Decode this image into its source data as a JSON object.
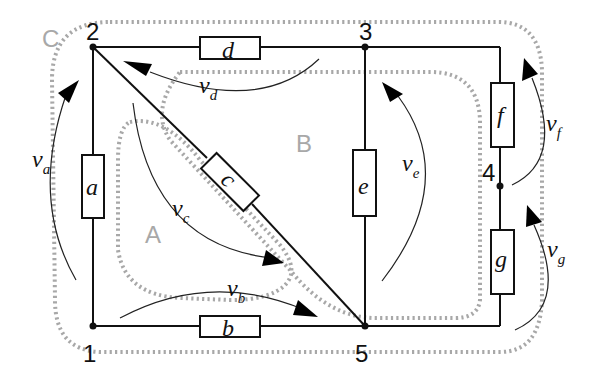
{
  "diagram": {
    "type": "electric-circuit",
    "nodes": [
      {
        "id": "1",
        "label": "1"
      },
      {
        "id": "2",
        "label": "2"
      },
      {
        "id": "3",
        "label": "3"
      },
      {
        "id": "4",
        "label": "4"
      },
      {
        "id": "5",
        "label": "5"
      }
    ],
    "branches": [
      {
        "id": "a",
        "label": "a",
        "from": "1",
        "to": "2",
        "voltage": {
          "symbol": "v",
          "sub": "a"
        }
      },
      {
        "id": "b",
        "label": "b",
        "from": "1",
        "to": "5",
        "voltage": {
          "symbol": "v",
          "sub": "b"
        }
      },
      {
        "id": "c",
        "label": "c",
        "from": "2",
        "to": "5",
        "voltage": {
          "symbol": "v",
          "sub": "c"
        }
      },
      {
        "id": "d",
        "label": "d",
        "from": "3",
        "to": "2",
        "voltage": {
          "symbol": "v",
          "sub": "d"
        }
      },
      {
        "id": "e",
        "label": "e",
        "from": "5",
        "to": "3",
        "voltage": {
          "symbol": "v",
          "sub": "e"
        }
      },
      {
        "id": "f",
        "label": "f",
        "from": "4",
        "to": "3",
        "voltage": {
          "symbol": "v",
          "sub": "f"
        }
      },
      {
        "id": "g",
        "label": "g",
        "from": "5",
        "to": "4",
        "voltage": {
          "symbol": "v",
          "sub": "g"
        }
      }
    ],
    "loops": [
      {
        "id": "A",
        "label": "A",
        "branches": [
          "a",
          "b",
          "c"
        ]
      },
      {
        "id": "B",
        "label": "B",
        "branches": [
          "c",
          "d",
          "e"
        ]
      },
      {
        "id": "C",
        "label": "C",
        "branches": [
          "a",
          "b",
          "g",
          "f",
          "d"
        ]
      }
    ],
    "colors": {
      "wire": "#111111",
      "loop": "#a8a8a8",
      "background": "#ffffff"
    }
  }
}
